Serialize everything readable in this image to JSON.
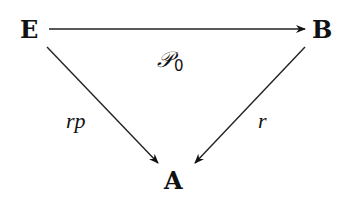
{
  "diagram": {
    "type": "commutative-triangle",
    "nodes": {
      "E": {
        "label": "E"
      },
      "B": {
        "label": "B"
      },
      "A": {
        "label": "A"
      }
    },
    "arrows": [
      {
        "from": "E",
        "to": "B",
        "label": "𝒫",
        "label_subscript": "0"
      },
      {
        "from": "E",
        "to": "A",
        "label": "rp"
      },
      {
        "from": "B",
        "to": "A",
        "label": "r"
      }
    ],
    "colors": {
      "ink": "#111111",
      "background": "#ffffff"
    }
  }
}
